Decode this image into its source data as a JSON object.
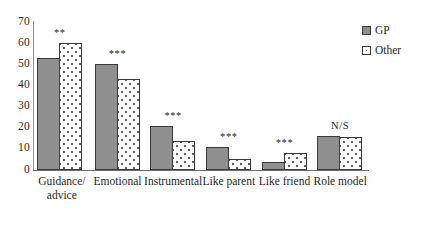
{
  "chart_data": {
    "type": "bar",
    "title": "",
    "subtitle": "",
    "xlabel": "",
    "ylabel": "",
    "ylim": [
      0,
      70
    ],
    "ytick_step": 10,
    "yticks": [
      "70",
      "60",
      "50",
      "40",
      "30",
      "20",
      "10",
      "0"
    ],
    "grid": false,
    "legend_position": "top-right",
    "categories": [
      "Guidance/ advice",
      "Emotional",
      "Instrumental",
      "Like parent",
      "Like friend",
      "Role model"
    ],
    "category_lines": [
      [
        "Guidance/",
        "advice"
      ],
      [
        "Emotional"
      ],
      [
        "Instrumental"
      ],
      [
        "Like parent"
      ],
      [
        "Like friend"
      ],
      [
        "Role model"
      ]
    ],
    "series": [
      {
        "name": "GP",
        "color": "#8f8f8f",
        "pattern": "solid",
        "values": [
          53,
          50,
          21,
          11,
          4,
          16
        ]
      },
      {
        "name": "Other",
        "color": "#fbfbfb",
        "pattern": "dotted",
        "values": [
          60,
          43,
          13.5,
          5,
          8,
          15.5
        ]
      }
    ],
    "annotations": [
      {
        "category": "Guidance/ advice",
        "text": "**"
      },
      {
        "category": "Emotional",
        "text": "***"
      },
      {
        "category": "Instrumental",
        "text": "***"
      },
      {
        "category": "Like parent",
        "text": "***"
      },
      {
        "category": "Like friend",
        "text": "***"
      },
      {
        "category": "Role model",
        "text": "N/S"
      }
    ]
  },
  "legend": {
    "items": [
      {
        "label": "GP",
        "swatch": "solid-grey-swatch-icon"
      },
      {
        "label": "Other",
        "swatch": "dotted-swatch-icon"
      }
    ]
  }
}
